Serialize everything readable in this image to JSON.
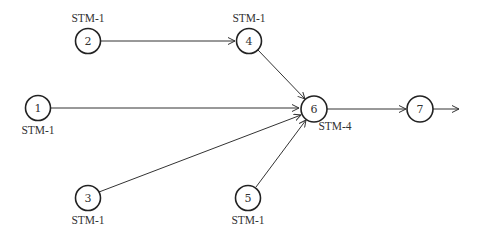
{
  "diagram": {
    "type": "network-topology",
    "colors": {
      "stroke": "#222222",
      "text": "#333333",
      "background": "#ffffff"
    },
    "nodes": [
      {
        "id": "1",
        "label": "STM-1",
        "x": 38,
        "y": 108,
        "label_x": 38,
        "label_y": 134
      },
      {
        "id": "2",
        "label": "STM-1",
        "x": 88,
        "y": 41,
        "label_x": 88,
        "label_y": 22
      },
      {
        "id": "3",
        "label": "STM-1",
        "x": 88,
        "y": 198,
        "label_x": 88,
        "label_y": 224
      },
      {
        "id": "4",
        "label": "STM-1",
        "x": 249,
        "y": 41,
        "label_x": 249,
        "label_y": 22
      },
      {
        "id": "5",
        "label": "STM-1",
        "x": 248,
        "y": 198,
        "label_x": 248,
        "label_y": 224
      },
      {
        "id": "6",
        "label": "STM-4",
        "x": 314,
        "y": 109,
        "label_x": 335,
        "label_y": 130
      },
      {
        "id": "7",
        "label": "",
        "x": 420,
        "y": 109,
        "label_x": 420,
        "label_y": 130
      }
    ],
    "edges": [
      {
        "from": "2",
        "to": "4"
      },
      {
        "from": "4",
        "to": "6"
      },
      {
        "from": "1",
        "to": "6"
      },
      {
        "from": "3",
        "to": "6"
      },
      {
        "from": "5",
        "to": "6"
      },
      {
        "from": "6",
        "to": "7"
      },
      {
        "from": "7",
        "to": "out"
      }
    ]
  }
}
